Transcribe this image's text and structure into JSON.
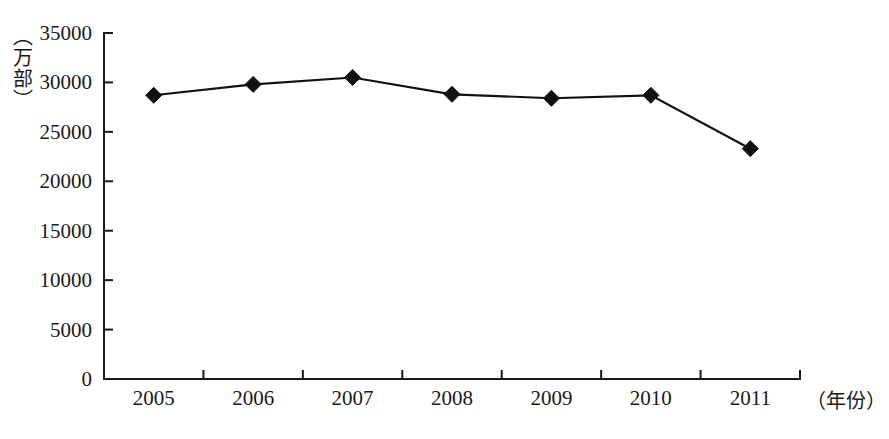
{
  "chart_data": {
    "type": "line",
    "title": "",
    "subtitle": "",
    "xlabel": "（年份）",
    "ylabel": "（万部）",
    "categories": [
      "2005",
      "2006",
      "2007",
      "2008",
      "2009",
      "2010",
      "2011"
    ],
    "values": [
      28700,
      29800,
      30500,
      28800,
      28400,
      28700,
      23300
    ],
    "series": [
      {
        "name": "",
        "values": [
          28700,
          29800,
          30500,
          28800,
          28400,
          28700,
          23300
        ]
      }
    ],
    "ylim": [
      0,
      35000
    ],
    "ytick_values": [
      0,
      5000,
      10000,
      15000,
      20000,
      25000,
      30000,
      35000
    ],
    "ytick_labels": [
      "0",
      "5000",
      "10000",
      "15000",
      "20000",
      "25000",
      "30000",
      "35000"
    ],
    "xtick_labels": [
      "2005",
      "2006",
      "2007",
      "2008",
      "2009",
      "2010",
      "2011"
    ],
    "grid": false,
    "legend": false,
    "legend_position": "none",
    "marker": "diamond",
    "line_color": "#111111",
    "marker_color": "#111111",
    "axis_color": "#1a1a1a",
    "background_color": "#ffffff",
    "annotations": []
  }
}
